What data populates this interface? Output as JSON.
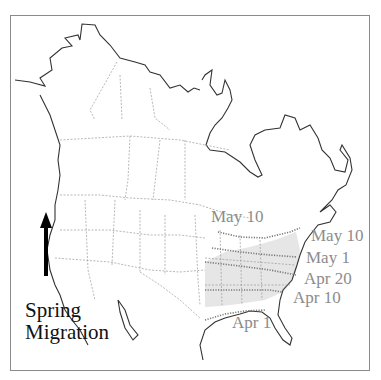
{
  "title": {
    "line1": "Spring",
    "line2": "Migration"
  },
  "icons": {
    "direction": "arrow-up-icon"
  },
  "labels": {
    "may10_inland": "May 10",
    "may10": "May 10",
    "may1": "May 1",
    "apr20": "Apr 20",
    "apr10": "Apr 10",
    "apr1": "Apr 1"
  },
  "colors": {
    "coastline": "#333333",
    "borders": "#9a9a9a",
    "range_fill": "#e6e6e6",
    "isoline": "#7a7a7a",
    "label_text": "#8c8c8c",
    "title_text": "#111111",
    "frame": "#8a8a8a"
  }
}
